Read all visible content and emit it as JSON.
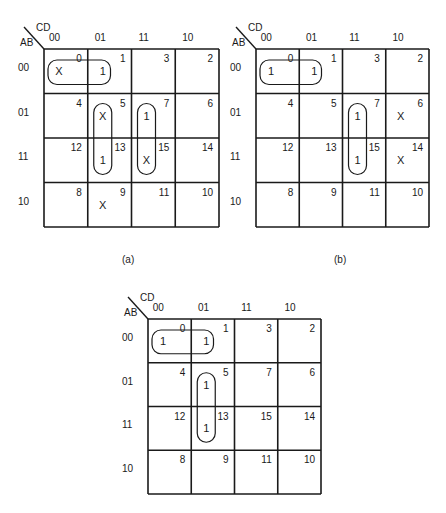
{
  "figure": {
    "row_var": "AB",
    "col_var": "CD",
    "col_headers": [
      "00",
      "01",
      "11",
      "10"
    ],
    "row_headers": [
      "00",
      "01",
      "11",
      "10"
    ],
    "cell_numbers": [
      [
        "0",
        "1",
        "3",
        "2"
      ],
      [
        "4",
        "5",
        "7",
        "6"
      ],
      [
        "12",
        "13",
        "15",
        "14"
      ],
      [
        "8",
        "9",
        "11",
        "10"
      ]
    ]
  },
  "maps": [
    {
      "id": "a",
      "caption": "(a)",
      "values": [
        [
          "X",
          "1",
          "",
          ""
        ],
        [
          "",
          "X",
          "1",
          ""
        ],
        [
          "",
          "1",
          "X",
          ""
        ],
        [
          "",
          "X",
          "",
          ""
        ]
      ],
      "groups": [
        {
          "row": 0,
          "col": 0,
          "rows": 1,
          "cols": 2
        },
        {
          "row": 1,
          "col": 1,
          "rows": 2,
          "cols": 1
        },
        {
          "row": 1,
          "col": 2,
          "rows": 2,
          "cols": 1
        }
      ]
    },
    {
      "id": "b",
      "caption": "(b)",
      "values": [
        [
          "1",
          "1",
          "",
          ""
        ],
        [
          "",
          "",
          "1",
          "X"
        ],
        [
          "",
          "",
          "1",
          "X"
        ],
        [
          "",
          "",
          "",
          ""
        ]
      ],
      "groups": [
        {
          "row": 0,
          "col": 0,
          "rows": 1,
          "cols": 2
        },
        {
          "row": 1,
          "col": 2,
          "rows": 2,
          "cols": 1
        }
      ]
    },
    {
      "id": "c",
      "caption": "",
      "values": [
        [
          "1",
          "1",
          "",
          ""
        ],
        [
          "",
          "1",
          "",
          ""
        ],
        [
          "",
          "1",
          "",
          ""
        ],
        [
          "",
          "",
          "",
          ""
        ]
      ],
      "groups": [
        {
          "row": 0,
          "col": 0,
          "rows": 1,
          "cols": 2
        },
        {
          "row": 1,
          "col": 1,
          "rows": 2,
          "cols": 1
        }
      ]
    }
  ]
}
